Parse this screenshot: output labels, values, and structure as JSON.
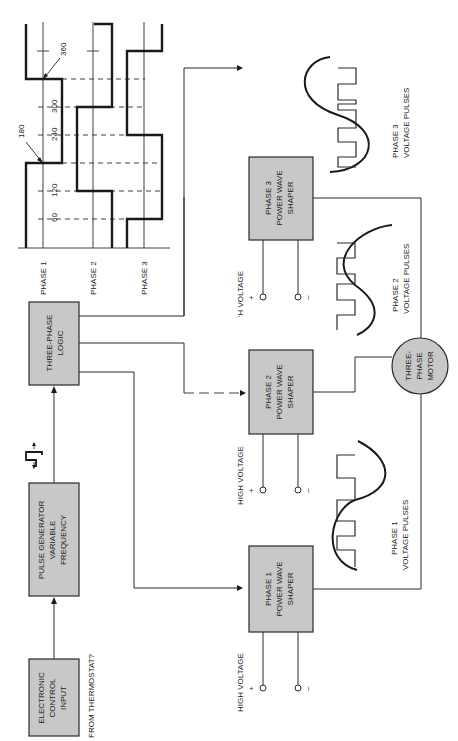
{
  "diagram": {
    "colors": {
      "box_fill": "#c8c8c8",
      "line": "#2a2a2a",
      "background": "#ffffff"
    },
    "blocks": {
      "electronic_control": [
        "ELECTRONIC",
        "CONTROL",
        "INPUT"
      ],
      "pulse_generator": [
        "PULSE GENERATOR",
        "VARIABLE",
        "FREQUENCY"
      ],
      "three_phase_logic": [
        "THREE-PHASE",
        "LOGIC"
      ],
      "phase1_shaper": [
        "PHASE 1",
        "POWER WAVE",
        "SHAPER"
      ],
      "phase2_shaper": [
        "PHASE 2",
        "POWER WAVE",
        "SHAPER"
      ],
      "phase3_shaper": [
        "PHASE 3",
        "POWER WAVE",
        "SHAPER"
      ],
      "motor": [
        "THREE-",
        "PHASE",
        "MOTOR"
      ]
    },
    "labels": {
      "from_thermostat": "FROM THERMOSTAT?",
      "high_voltage_1": "HIGH VOLTAGE",
      "high_voltage_2": "HIGH VOLTAGE",
      "high_voltage_3": "'H VOLTAGE",
      "plus": "+",
      "minus": "–",
      "pulses_1": [
        "PHASE 1",
        "VOLTAGE PULSES"
      ],
      "pulses_2": [
        "PHASE 2",
        "VOLTAGE PULSES"
      ],
      "pulses_3": [
        "PHASE 3",
        "VOLTAGE PULSES"
      ]
    },
    "timing": {
      "phase_labels": [
        "PHASE 1",
        "PHASE 2",
        "PHASE 3"
      ],
      "degree_ticks": [
        "60",
        "120",
        "180",
        "240",
        "300",
        "360"
      ]
    }
  }
}
